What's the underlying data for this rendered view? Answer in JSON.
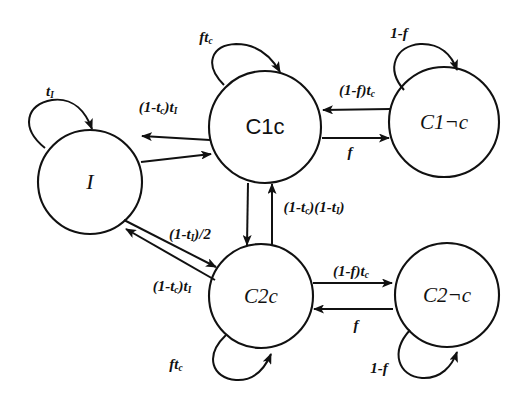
{
  "diagram": {
    "background_color": "#ffffff",
    "stroke_color": "#111111",
    "nodes": [
      {
        "id": "I",
        "label": "I",
        "style": "serif-italic",
        "cx": 90,
        "cy": 182,
        "r": 52,
        "font_size": 22
      },
      {
        "id": "C1c",
        "label": "C1c",
        "style": "sans-upright",
        "cx": 265,
        "cy": 127,
        "r": 56,
        "font_size": 22
      },
      {
        "id": "C1nc",
        "label": "C1¬c",
        "style": "serif-italic",
        "cx": 444,
        "cy": 122,
        "r": 55,
        "font_size": 21
      },
      {
        "id": "C2c",
        "label": "C2c",
        "style": "serif-italic",
        "cx": 261,
        "cy": 296,
        "r": 52,
        "font_size": 21
      },
      {
        "id": "C2nc",
        "label": "C2¬c",
        "style": "serif-italic",
        "cx": 447,
        "cy": 295,
        "r": 52,
        "font_size": 21
      }
    ],
    "edges": [
      {
        "id": "I-self",
        "from": "I",
        "to": "I",
        "kind": "self-loop",
        "label_html": "t<sub>I</sub>",
        "label_x": 50,
        "label_y": 92,
        "font_size": 15
      },
      {
        "id": "C1c-self",
        "from": "C1c",
        "to": "C1c",
        "kind": "self-loop",
        "label_html": "ft<sub>c</sub>",
        "label_x": 206,
        "label_y": 38,
        "font_size": 15
      },
      {
        "id": "C1nc-self",
        "from": "C1nc",
        "to": "C1nc",
        "kind": "self-loop",
        "label_html": "1-f",
        "label_x": 399,
        "label_y": 33,
        "font_size": 15
      },
      {
        "id": "C2c-self",
        "from": "C2c",
        "to": "C2c",
        "kind": "self-loop",
        "label_html": "ft<sub>c</sub>",
        "label_x": 176,
        "label_y": 365,
        "font_size": 15
      },
      {
        "id": "C2nc-self",
        "from": "C2nc",
        "to": "C2nc",
        "kind": "self-loop",
        "label_html": "1-f",
        "label_x": 379,
        "label_y": 368,
        "font_size": 15
      },
      {
        "id": "C1c-to-I",
        "from": "C1c",
        "to": "I",
        "kind": "straight",
        "label_html": "(1-t<sub>c</sub>)t<sub>I</sub>",
        "label_x": 158,
        "label_y": 108,
        "font_size": 15
      },
      {
        "id": "I-to-C1c",
        "from": "I",
        "to": "C1c",
        "kind": "straight",
        "label_html": "",
        "label_x": 0,
        "label_y": 0,
        "font_size": 15
      },
      {
        "id": "C1nc-to-C1c",
        "from": "C1nc",
        "to": "C1c",
        "kind": "straight",
        "label_html": "(1-f)t<sub>c</sub>",
        "label_x": 357,
        "label_y": 91,
        "font_size": 15
      },
      {
        "id": "C1c-to-C1nc",
        "from": "C1c",
        "to": "C1nc",
        "kind": "straight",
        "label_html": "f",
        "label_x": 350,
        "label_y": 152,
        "font_size": 15
      },
      {
        "id": "C1c-to-C2c",
        "from": "C1c",
        "to": "C2c",
        "kind": "straight",
        "label_html": "",
        "label_x": 0,
        "label_y": 0,
        "font_size": 15
      },
      {
        "id": "C2c-to-C1c",
        "from": "C2c",
        "to": "C1c",
        "kind": "straight",
        "label_html": "(1-t<sub>c</sub>)(1-t<sub>I</sub>)",
        "label_x": 314,
        "label_y": 208,
        "font_size": 15
      },
      {
        "id": "I-to-C2c",
        "from": "I",
        "to": "C2c",
        "kind": "straight",
        "label_html": "(1-t<sub>I</sub>)/2",
        "label_x": 190,
        "label_y": 235,
        "font_size": 15
      },
      {
        "id": "C2c-to-I",
        "from": "C2c",
        "to": "I",
        "kind": "straight",
        "label_html": "(1-t<sub>c</sub>)t<sub>I</sub>",
        "label_x": 172,
        "label_y": 287,
        "font_size": 15
      },
      {
        "id": "C2c-to-C2nc",
        "from": "C2c",
        "to": "C2nc",
        "kind": "straight",
        "label_html": "(1-f)t<sub>c</sub>",
        "label_x": 351,
        "label_y": 272,
        "font_size": 15
      },
      {
        "id": "C2nc-to-C2c",
        "from": "C2nc",
        "to": "C2c",
        "kind": "straight",
        "label_html": "f",
        "label_x": 356,
        "label_y": 325,
        "font_size": 15
      }
    ]
  }
}
